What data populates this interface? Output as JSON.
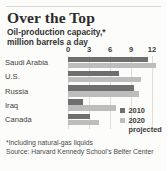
{
  "chart_data": {
    "type": "bar",
    "orientation": "horizontal",
    "title": "Over the Top",
    "subtitle": "Oil-production capacity,* million barrels a day",
    "subtitle_line1": "Oil-production capacity,*",
    "subtitle_line2": "million barrels a day",
    "categories": [
      "Saudi Arabia",
      "U.S.",
      "Russia",
      "Iraq",
      "Canada"
    ],
    "series": [
      {
        "name": "2010",
        "color": "#6f6f6f",
        "values": [
          11.4,
          7.3,
          9.4,
          2.1,
          3.1
        ]
      },
      {
        "name": "2020 projected",
        "color": "#bdbdbd",
        "values": [
          12.6,
          10.4,
          10.1,
          6.9,
          4.4
        ]
      }
    ],
    "xlabel": "",
    "ylabel": "",
    "xlim": [
      0,
      13.2
    ],
    "xticks": [
      0,
      3,
      6,
      9,
      12
    ],
    "xtick_labels": [
      "0",
      "3",
      "6",
      "9",
      "12"
    ],
    "grid": true,
    "grid_axis": "x",
    "legend_position": "bottom-right",
    "legend": [
      {
        "label": "2010",
        "sublabel": "",
        "color": "#6f6f6f"
      },
      {
        "label": "2020",
        "sublabel": "projected",
        "color": "#bdbdbd"
      }
    ],
    "footnotes": [
      "*Including natural-gas liquids",
      "Source: Harvard Kennedy School's Belfer Center"
    ]
  }
}
